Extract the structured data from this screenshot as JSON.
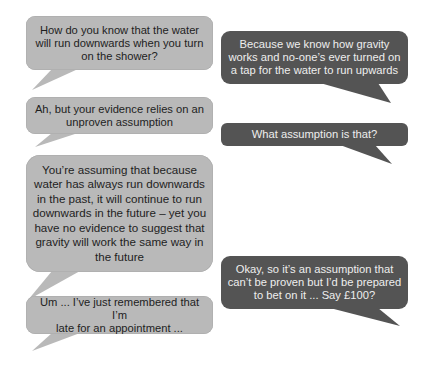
{
  "colors": {
    "speaker_a_bubble": "#b9b9b9",
    "speaker_a_text": "#1e1e1e",
    "speaker_b_bubble": "#545454",
    "speaker_b_text": "#eeeeee",
    "background": "#ffffff"
  },
  "dialogue": {
    "left": [
      {
        "text": "How do you know that the water\nwill run downwards when you turn\non the shower?"
      },
      {
        "text": "Ah, but your evidence relies on an\nunproven assumption"
      },
      {
        "text": "You’re assuming that because\nwater has always run downwards\nin the past, it will continue to run\ndownwards in the future – yet you\nhave no evidence to suggest that\ngravity will work the same way in\nthe future"
      },
      {
        "text": "Um ... I’ve just remembered that I’m\nlate for an appointment ..."
      }
    ],
    "right": [
      {
        "text": "Because we know how gravity\nworks and no-one’s ever turned on\na tap for the water to run upwards"
      },
      {
        "text": "What assumption is that?"
      },
      {
        "text": "Okay, so it’s an assumption that\ncan’t be proven but I’d be prepared\nto bet on it ... Say £100?"
      }
    ]
  }
}
